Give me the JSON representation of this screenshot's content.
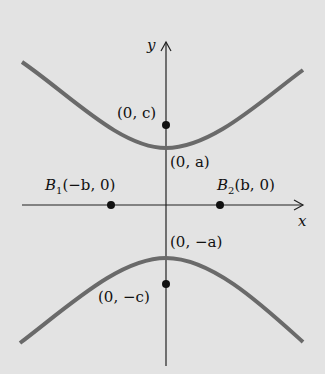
{
  "diagram": {
    "axes": {
      "x_label": "x",
      "y_label": "y"
    },
    "points": {
      "focus_top": "(0, c)",
      "vertex_top": "(0, a)",
      "vertex_bottom": "(0, −a)",
      "focus_bottom": "(0, −c)",
      "b1_name": "B",
      "b1_sub": "1",
      "b1_coords": "(−b, 0)",
      "b2_name": "B",
      "b2_sub": "2",
      "b2_coords": "(b, 0)"
    },
    "colors": {
      "background": "#e3e3e3",
      "curve": "#6a6a6a",
      "axes": "#222222"
    }
  }
}
